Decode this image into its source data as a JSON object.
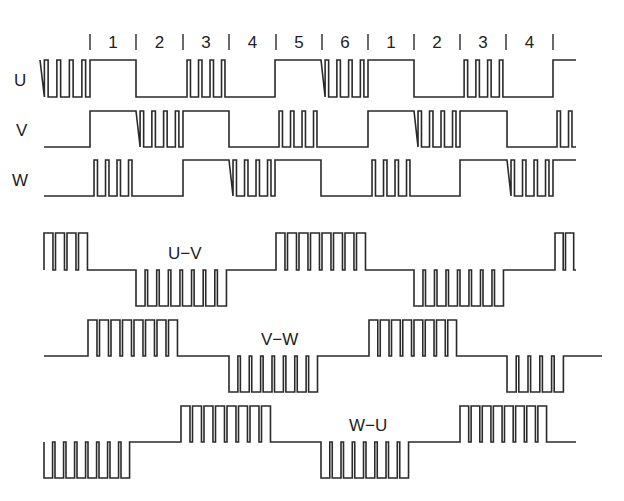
{
  "colors": {
    "stroke": "#2a2a2a",
    "background": "#ffffff",
    "text": "#222222"
  },
  "sectors": {
    "labels": [
      "1",
      "2",
      "3",
      "4",
      "5",
      "6",
      "1",
      "2",
      "3",
      "4"
    ],
    "boundaries_x": [
      90,
      136,
      183,
      229,
      276,
      322,
      368,
      414,
      460,
      506,
      553
    ],
    "label_y": 48
  },
  "phases": [
    {
      "name": "U",
      "label_x": 14,
      "label_y": 86,
      "y_high": 60,
      "y_low": 97,
      "x_start": 40,
      "x_end": 576,
      "segments": [
        "pwm4",
        "high",
        "low",
        "pwm4",
        "low",
        "high",
        "pwm4",
        "high",
        "low",
        "pwm4",
        "low",
        "high"
      ]
    },
    {
      "name": "V",
      "label_x": 16,
      "label_y": 136,
      "y_high": 111,
      "y_low": 147,
      "x_start": 44,
      "x_end": 576,
      "segments": [
        "low",
        "high",
        "pwm4",
        "high",
        "low",
        "pwm4",
        "low",
        "high",
        "pwm4",
        "high",
        "low",
        "pwm2"
      ]
    },
    {
      "name": "W",
      "label_x": 12,
      "label_y": 186,
      "y_high": 160,
      "y_low": 196,
      "x_start": 44,
      "x_end": 576,
      "segments": [
        "low",
        "pwm4",
        "low",
        "high",
        "pwm4",
        "high",
        "low",
        "pwm4",
        "low",
        "high",
        "pwm4",
        "high"
      ]
    }
  ],
  "line_voltages": [
    {
      "name": "U−V",
      "label_x": 168,
      "label_y": 259,
      "baseline": 270,
      "top": 233,
      "bottom": 306,
      "x_start": 44,
      "x_end": 576,
      "blocks": [
        {
          "from": 44,
          "to": 90,
          "dir": "up",
          "pulses": 4
        },
        {
          "from": 136,
          "to": 229,
          "dir": "down",
          "pulses": 8
        },
        {
          "from": 276,
          "to": 368,
          "dir": "up",
          "pulses": 8
        },
        {
          "from": 414,
          "to": 506,
          "dir": "down",
          "pulses": 8
        },
        {
          "from": 555,
          "to": 576,
          "dir": "up",
          "pulses": 2
        }
      ]
    },
    {
      "name": "V−W",
      "label_x": 261,
      "label_y": 345,
      "baseline": 356,
      "top": 320,
      "bottom": 392,
      "x_start": 44,
      "x_end": 602,
      "blocks": [
        {
          "from": 88,
          "to": 180,
          "dir": "up",
          "pulses": 8
        },
        {
          "from": 229,
          "to": 320,
          "dir": "down",
          "pulses": 8
        },
        {
          "from": 369,
          "to": 459,
          "dir": "up",
          "pulses": 8
        },
        {
          "from": 507,
          "to": 566,
          "dir": "down",
          "pulses": 5
        }
      ]
    },
    {
      "name": "W−U",
      "label_x": 349,
      "label_y": 431,
      "baseline": 442,
      "top": 406,
      "bottom": 478,
      "x_start": 44,
      "x_end": 576,
      "blocks": [
        {
          "from": 44,
          "to": 132,
          "dir": "down",
          "pulses": 8
        },
        {
          "from": 181,
          "to": 273,
          "dir": "up",
          "pulses": 8
        },
        {
          "from": 321,
          "to": 411,
          "dir": "down",
          "pulses": 8
        },
        {
          "from": 460,
          "to": 549,
          "dir": "up",
          "pulses": 8
        }
      ]
    }
  ]
}
